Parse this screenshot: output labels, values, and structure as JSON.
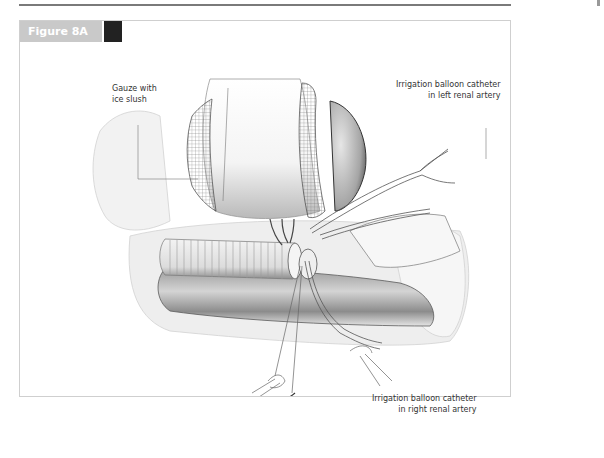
{
  "figure": {
    "title": "Figure 8A",
    "tab_color": "#c9c9c9",
    "tab_accent_color": "#222222"
  },
  "labels": {
    "gauze": {
      "line1": "Gauze with",
      "line2": "ice slush"
    },
    "left_catheter": {
      "line1": "Irrigation balloon catheter",
      "line2": "in left renal artery"
    },
    "right_catheter": {
      "line1": "Irrigation balloon catheter",
      "line2": "in right renal artery"
    }
  },
  "illustration": {
    "subject": "surgical-illustration-renal-cooling",
    "elements": [
      "gauze-wrapped-kidney",
      "ribbed-graft",
      "aorta",
      "clamps",
      "irrigation-catheters",
      "sutures"
    ]
  }
}
